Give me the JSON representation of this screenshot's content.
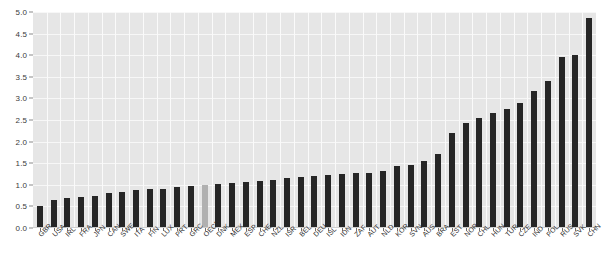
{
  "chart_data": {
    "type": "bar",
    "title": "",
    "subtitle": "",
    "xlabel": "",
    "ylabel": "",
    "ylim": [
      0.0,
      5.0
    ],
    "ytick_labels": [
      "0.0",
      "0.5",
      "1.0",
      "1.5",
      "2.0",
      "2.5",
      "3.0",
      "3.5",
      "4.0",
      "4.5",
      "5.0"
    ],
    "ytick_values": [
      0.0,
      0.5,
      1.0,
      1.5,
      2.0,
      2.5,
      3.0,
      3.5,
      4.0,
      4.5,
      5.0
    ],
    "grid": true,
    "legend": "none",
    "highlight_category": "OECD",
    "colors": {
      "bar": "#262626",
      "highlight_bar": "#b0b0b0",
      "plot_background": "#e6e6e6",
      "gridline": "#f7f7f7",
      "page_background": "#ffffff",
      "tick_label": "#2b2b2b"
    },
    "categories": [
      "GBR",
      "USA",
      "IRL",
      "FRA",
      "JPN",
      "CAN",
      "SWE",
      "ITA",
      "FIN",
      "LUX",
      "PRT",
      "GRC",
      "OECD",
      "DNK",
      "MEX",
      "ESP",
      "CHE",
      "NZL",
      "ISR",
      "BEL",
      "DEU",
      "ISL",
      "IDN",
      "ZAF",
      "AUT",
      "NLD",
      "KOR",
      "SVN",
      "AUS",
      "BRA",
      "EST",
      "NOR",
      "CHL",
      "HUN",
      "TUR",
      "CZE",
      "IND",
      "POL",
      "RUS",
      "SVK",
      "CHN"
    ],
    "values": [
      0.5,
      0.65,
      0.7,
      0.71,
      0.73,
      0.81,
      0.84,
      0.89,
      0.9,
      0.91,
      0.94,
      0.97,
      1.0,
      1.02,
      1.05,
      1.07,
      1.09,
      1.11,
      1.15,
      1.18,
      1.2,
      1.23,
      1.26,
      1.27,
      1.28,
      1.32,
      1.43,
      1.47,
      1.55,
      1.72,
      2.2,
      2.42,
      2.55,
      2.66,
      2.75,
      2.9,
      3.18,
      3.4,
      3.95,
      4.0,
      4.85
    ]
  }
}
